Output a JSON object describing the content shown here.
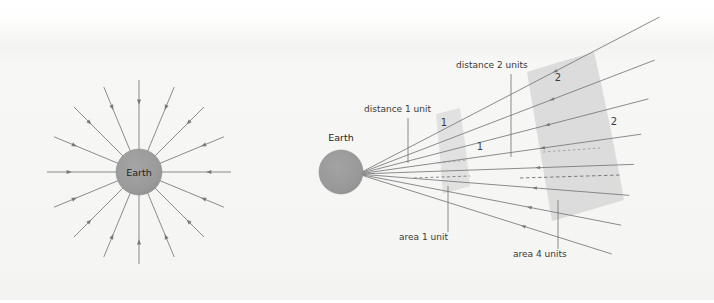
{
  "figure": {
    "width": 714,
    "height": 303,
    "background_color": "#ffffff",
    "paper_tint_color": "#f5f5f3"
  },
  "colors": {
    "earth_fill": "#9a9a9a",
    "earth_stroke": "#8e8e8e",
    "ray_stroke": "#77777a",
    "patch_fill": "#dedede",
    "patch_fill_far": "#d9d9d9",
    "leader_stroke": "#6f6f72",
    "text": "#3a3a3a",
    "dash_stroke": "#6f6f72"
  },
  "left_panel": {
    "name": "radial-field-diagram",
    "earth_label": "Earth",
    "earth_center": {
      "x": 139,
      "y": 172
    },
    "earth_radius": 23,
    "ray_count": 16,
    "ray_inner_radius": 23,
    "ray_outer_radius": 92,
    "arrow_direction": "inward",
    "arrow_position_fraction": 0.72
  },
  "right_panel": {
    "name": "inverse-square-diagram",
    "earth_label": "Earth",
    "earth_center": {
      "x": 341,
      "y": 172
    },
    "earth_radius": 22,
    "apex": {
      "x": 358,
      "y": 174
    },
    "labels": [
      {
        "id": "distance-1-unit",
        "text": "distance 1 unit",
        "text_x": 364,
        "text_y": 112,
        "leader_x": 408,
        "leader_y1": 118,
        "leader_y2": 163
      },
      {
        "id": "distance-2-units",
        "text": "distance 2 units",
        "text_x": 456,
        "text_y": 68,
        "leader_x": 511,
        "leader_y1": 74,
        "leader_y2": 157
      },
      {
        "id": "area-1-unit",
        "text": "area 1 unit",
        "text_x": 399,
        "text_y": 240,
        "leader_x": 448,
        "leader_y1": 186,
        "leader_y2": 232
      },
      {
        "id": "area-4-units",
        "text": "area 4 units",
        "text_x": 513,
        "text_y": 257,
        "leader_x": 558,
        "leader_y1": 200,
        "leader_y2": 249
      }
    ],
    "dimension_labels": [
      {
        "id": "near-patch-top",
        "text": "1",
        "x": 444,
        "y": 126
      },
      {
        "id": "near-patch-side",
        "text": "1",
        "x": 480,
        "y": 150
      },
      {
        "id": "far-patch-top",
        "text": "2",
        "x": 558,
        "y": 81
      },
      {
        "id": "far-patch-side",
        "text": "2",
        "x": 614,
        "y": 125
      }
    ],
    "near_patch": {
      "id": "area-1-unit-patch",
      "label": "area 1 unit",
      "distance_units": 1,
      "area_units": 1
    },
    "far_patch": {
      "id": "area-4-units-patch",
      "label": "area 4 units",
      "distance_units": 2,
      "area_units": 4
    },
    "ray_count": 8,
    "ray_angles_deg": [
      -27.5,
      -21.0,
      -14.5,
      -8.0,
      -2.0,
      4.5,
      11.0,
      17.5
    ]
  }
}
